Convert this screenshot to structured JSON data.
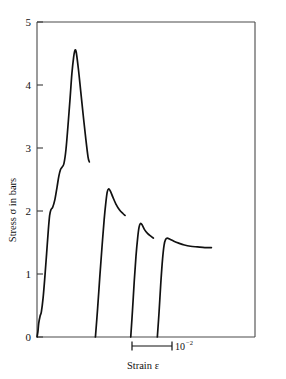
{
  "chart_data": {
    "type": "line",
    "title": "",
    "xlabel": "Strain ε",
    "ylabel": "Stress σ in bars",
    "ylim": [
      0,
      5
    ],
    "xlim": [
      0,
      1
    ],
    "grid": false,
    "legend": null,
    "y_ticks": [
      "0",
      "1",
      "2",
      "3",
      "4",
      "5"
    ],
    "y_tick_values": [
      0,
      1,
      2,
      3,
      4,
      5
    ],
    "x_ticks": [],
    "x_scale_bar": {
      "label": "10",
      "exponent": "−2",
      "full_label": "10⁻²",
      "description": "horizontal scale bar marking one unit of 10^-2 strain"
    },
    "series": [
      {
        "name": "cycle-1",
        "peak_stress": 4.55,
        "end_stress": 2.78,
        "points": [
          [
            0.0,
            0.0
          ],
          [
            0.004,
            0.08
          ],
          [
            0.008,
            0.22
          ],
          [
            0.014,
            0.33
          ],
          [
            0.02,
            0.4
          ],
          [
            0.028,
            0.62
          ],
          [
            0.036,
            0.95
          ],
          [
            0.044,
            1.32
          ],
          [
            0.052,
            1.7
          ],
          [
            0.058,
            1.93
          ],
          [
            0.064,
            2.02
          ],
          [
            0.072,
            2.06
          ],
          [
            0.082,
            2.18
          ],
          [
            0.092,
            2.38
          ],
          [
            0.1,
            2.55
          ],
          [
            0.108,
            2.66
          ],
          [
            0.116,
            2.7
          ],
          [
            0.124,
            2.76
          ],
          [
            0.133,
            2.98
          ],
          [
            0.142,
            3.35
          ],
          [
            0.152,
            3.8
          ],
          [
            0.16,
            4.18
          ],
          [
            0.168,
            4.44
          ],
          [
            0.174,
            4.55
          ],
          [
            0.18,
            4.52
          ],
          [
            0.19,
            4.25
          ],
          [
            0.2,
            3.92
          ],
          [
            0.212,
            3.52
          ],
          [
            0.224,
            3.14
          ],
          [
            0.234,
            2.86
          ],
          [
            0.24,
            2.78
          ]
        ]
      },
      {
        "name": "cycle-2",
        "peak_stress": 2.35,
        "end_stress": 1.93,
        "points": [
          [
            0.268,
            0.0
          ],
          [
            0.278,
            0.45
          ],
          [
            0.288,
            0.95
          ],
          [
            0.298,
            1.42
          ],
          [
            0.308,
            1.86
          ],
          [
            0.316,
            2.14
          ],
          [
            0.322,
            2.3
          ],
          [
            0.328,
            2.35
          ],
          [
            0.336,
            2.32
          ],
          [
            0.348,
            2.22
          ],
          [
            0.362,
            2.11
          ],
          [
            0.378,
            2.02
          ],
          [
            0.394,
            1.96
          ],
          [
            0.404,
            1.93
          ]
        ]
      },
      {
        "name": "cycle-3",
        "peak_stress": 1.8,
        "end_stress": 1.57,
        "points": [
          [
            0.43,
            0.0
          ],
          [
            0.438,
            0.42
          ],
          [
            0.446,
            0.88
          ],
          [
            0.454,
            1.28
          ],
          [
            0.462,
            1.58
          ],
          [
            0.468,
            1.74
          ],
          [
            0.474,
            1.8
          ],
          [
            0.482,
            1.78
          ],
          [
            0.494,
            1.7
          ],
          [
            0.508,
            1.64
          ],
          [
            0.522,
            1.6
          ],
          [
            0.534,
            1.57
          ]
        ]
      },
      {
        "name": "cycle-4",
        "peak_stress": 1.57,
        "end_stress": 1.42,
        "points": [
          [
            0.552,
            0.0
          ],
          [
            0.56,
            0.4
          ],
          [
            0.568,
            0.86
          ],
          [
            0.576,
            1.24
          ],
          [
            0.583,
            1.46
          ],
          [
            0.59,
            1.55
          ],
          [
            0.598,
            1.57
          ],
          [
            0.61,
            1.55
          ],
          [
            0.628,
            1.52
          ],
          [
            0.65,
            1.49
          ],
          [
            0.676,
            1.46
          ],
          [
            0.704,
            1.44
          ],
          [
            0.736,
            1.43
          ],
          [
            0.77,
            1.42
          ],
          [
            0.8,
            1.42
          ]
        ]
      }
    ]
  }
}
